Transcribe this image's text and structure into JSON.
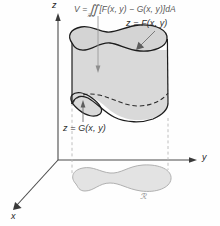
{
  "figure": {
    "background_color": "#fefefe"
  },
  "axes": {
    "z_label": "z",
    "y_label": "y",
    "x_label": "x",
    "axis_color": "#4a4a4a"
  },
  "formula": {
    "text": "V = ∬ [F(x, y) − G(x, y)]dA",
    "lead": "V =",
    "integral": "∬",
    "subscript": "ℛ",
    "body": "[F(x, y) − G(x, y)]dA",
    "color": "#575757"
  },
  "labels": {
    "upper_surface": "z = F(x, y)",
    "lower_surface": "z = G(x, y)",
    "region": "ℛ"
  },
  "colors": {
    "solid_fill": "#d9d9d9",
    "solid_top_fill": "#d4d4d4",
    "solid_stroke": "#1c1c1c",
    "region_fill": "#e3e3e3",
    "region_stroke": "#b0b0b0",
    "dashed_line": "#b9b9b9",
    "leader_line": "#6f6f6f"
  }
}
